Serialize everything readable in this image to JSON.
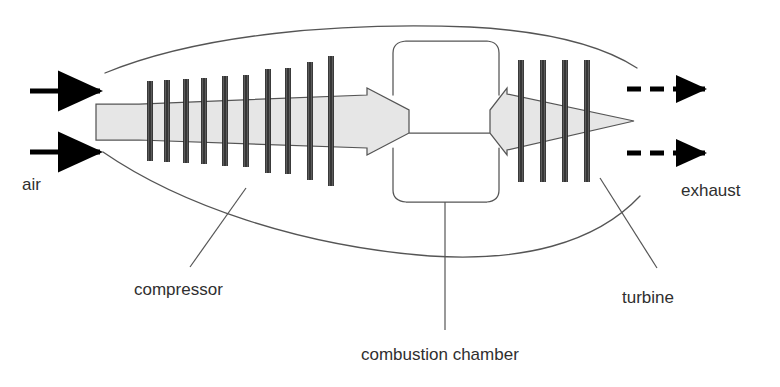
{
  "diagram": {
    "background_color": "#ffffff",
    "line_color": "#555555",
    "blade_color": "#1a1a1a",
    "body_fill": "#e6e6e6",
    "body_stroke": "#555555",
    "arrow_color": "#000000",
    "label_color": "#2f2f2f"
  },
  "labels": {
    "air": "air",
    "compressor": "compressor",
    "combustion_chamber": "combustion chamber",
    "turbine": "turbine",
    "exhaust": "exhaust"
  },
  "flow": {
    "intake_arrows": [
      {
        "name": "air-arrow-upper",
        "x1": 30,
        "y1": 91,
        "x2": 100,
        "y2": 91
      },
      {
        "name": "air-arrow-lower",
        "x1": 30,
        "y1": 152,
        "x2": 100,
        "y2": 152
      }
    ],
    "exhaust_arrows": [
      {
        "name": "exhaust-arrow-upper",
        "y": 89,
        "x_start": 627,
        "x_end": 705
      },
      {
        "name": "exhaust-arrow-lower",
        "y": 153,
        "x_start": 627,
        "x_end": 705
      }
    ],
    "exhaust_dash_pattern": "14 9"
  },
  "components": {
    "nacelle": {
      "name": "engine-nacelle-outline",
      "upper_path": "M 105,73 C 200,34 340,22 470,27 C 545,31 600,44 637,68",
      "lower_path": "M 103,152 C 180,205 300,246 430,256 C 520,262 595,244 640,196"
    },
    "rotor": {
      "name": "rotor-spool-body",
      "path": "M 96,104 L 139,104 L 367,95 L 367,88 L 409,110 L 409,133 L 490,133 L 490,110 L 507,88 L 507,94 L 634,121 L 507,150 L 507,155 L 490,133 L 409,133 L 409,133 L 367,155 L 367,148 L 139,140 L 96,140 Z"
    },
    "compressor_blades": [
      {
        "x": 150,
        "half_height": 40
      },
      {
        "x": 167,
        "half_height": 41
      },
      {
        "x": 186,
        "half_height": 42
      },
      {
        "x": 204,
        "half_height": 43
      },
      {
        "x": 225,
        "half_height": 45
      },
      {
        "x": 246,
        "half_height": 46
      },
      {
        "x": 268,
        "half_height": 52
      },
      {
        "x": 288,
        "half_height": 53
      },
      {
        "x": 310,
        "half_height": 59
      },
      {
        "x": 331,
        "half_height": 65
      }
    ],
    "turbine_blades": [
      {
        "x": 521,
        "half_height": 61
      },
      {
        "x": 543,
        "half_height": 61
      },
      {
        "x": 565,
        "half_height": 61
      },
      {
        "x": 587,
        "half_height": 61
      }
    ],
    "combustion_chamber": {
      "name": "combustion-chamber-outline",
      "upper_path": "M 393,95 L 393,53 Q 393,42 406,41 L 487,41 Q 499,42 499,53 L 499,95",
      "lower_path": "M 393,148 L 393,190 Q 393,201 406,202 L 487,202 Q 499,201 499,190 L 499,148"
    }
  },
  "leader_lines": [
    {
      "name": "compressor-leader-line",
      "x1": 246,
      "y1": 188,
      "x2": 190,
      "y2": 267
    },
    {
      "name": "combustion-chamber-leader-line",
      "x1": 445,
      "y1": 202,
      "x2": 445,
      "y2": 330
    },
    {
      "name": "turbine-leader-line",
      "x1": 600,
      "y1": 178,
      "x2": 657,
      "y2": 268
    }
  ],
  "label_positions": {
    "air": {
      "x": 22,
      "y": 190
    },
    "compressor": {
      "x": 134,
      "y": 295
    },
    "combustion_chamber": {
      "x": 361,
      "y": 360
    },
    "turbine": {
      "x": 622,
      "y": 303
    },
    "exhaust": {
      "x": 681,
      "y": 196
    }
  }
}
